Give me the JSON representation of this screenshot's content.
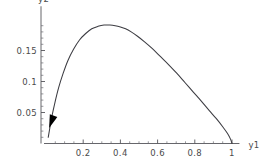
{
  "chart_data": {
    "type": "line",
    "title": "",
    "subtitle": "",
    "xlabel": "y1",
    "ylabel": "y2",
    "xlim": [
      0,
      1.04
    ],
    "ylim": [
      0,
      0.202
    ],
    "grid": false,
    "legend": null,
    "x_ticks": [
      {
        "value": 0.2,
        "label": "0.2"
      },
      {
        "value": 0.4,
        "label": "0.4"
      },
      {
        "value": 0.6,
        "label": "0.6"
      },
      {
        "value": 0.8,
        "label": "0.8"
      },
      {
        "value": 1.0,
        "label": "1"
      }
    ],
    "y_ticks": [
      {
        "value": 0.05,
        "label": "0.05"
      },
      {
        "value": 0.1,
        "label": "0.1"
      },
      {
        "value": 0.15,
        "label": "0.15"
      }
    ],
    "x_minor_ticks": [
      0.05,
      0.1,
      0.15,
      0.25,
      0.3,
      0.35,
      0.45,
      0.5,
      0.55,
      0.65,
      0.7,
      0.75,
      0.85,
      0.9,
      0.95
    ],
    "y_minor_ticks": [
      0.01,
      0.02,
      0.03,
      0.04,
      0.06,
      0.07,
      0.08,
      0.09,
      0.11,
      0.12,
      0.13,
      0.14,
      0.16,
      0.17,
      0.18,
      0.19
    ],
    "series": [
      {
        "name": "trajectory",
        "color": "#3c3c42",
        "x": [
          0.012,
          0.02,
          0.032,
          0.048,
          0.068,
          0.092,
          0.118,
          0.148,
          0.18,
          0.212,
          0.246,
          0.28,
          0.312,
          0.344,
          0.372,
          0.4,
          0.428,
          0.458,
          0.492,
          0.53,
          0.572,
          0.616,
          0.66,
          0.704,
          0.748,
          0.792,
          0.836,
          0.878,
          0.916,
          0.95,
          0.976,
          0.992,
          1.0
        ],
        "y": [
          0.01,
          0.024,
          0.044,
          0.066,
          0.09,
          0.113,
          0.134,
          0.152,
          0.167,
          0.177,
          0.185,
          0.189,
          0.191,
          0.191,
          0.19,
          0.188,
          0.185,
          0.18,
          0.173,
          0.164,
          0.153,
          0.14,
          0.127,
          0.113,
          0.098,
          0.083,
          0.068,
          0.053,
          0.04,
          0.027,
          0.016,
          0.007,
          0.0
        ]
      }
    ],
    "annotations": [
      {
        "name": "direction-arrow",
        "shape": "filled-triangle",
        "color": "#000000",
        "x": 0.03,
        "y": 0.036,
        "points_toward": "origin",
        "angle_deg": 250
      }
    ]
  }
}
